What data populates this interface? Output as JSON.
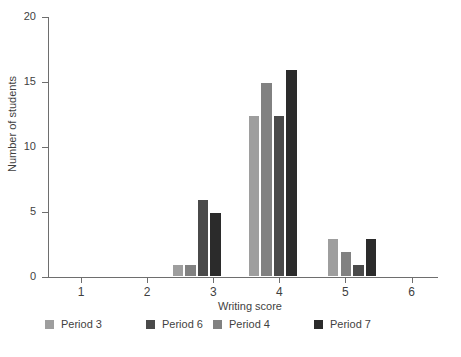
{
  "chart_data": {
    "type": "bar",
    "title": "",
    "subtitle": "",
    "xlabel": "Writing score",
    "ylabel": "Number of students",
    "xlim": [
      0.5,
      6.4
    ],
    "ylim": [
      0,
      20
    ],
    "xticks": [
      1,
      2,
      3,
      4,
      5,
      6
    ],
    "xtick_labels": [
      "1",
      "2",
      "3",
      "4",
      "5",
      "6"
    ],
    "yticks": [
      0,
      5,
      10,
      15,
      20
    ],
    "ytick_labels": [
      "0",
      "5",
      "10",
      "15",
      "20"
    ],
    "grid": false,
    "legend_position": "below-left",
    "bar_width": 0.19,
    "categories": [
      2.75,
      3.9,
      5.1
    ],
    "category_labels": [
      "2.75",
      "3.9",
      "5.1"
    ],
    "series": [
      {
        "name": "Period 3",
        "color": "#9e9e9e",
        "values": [
          1,
          12.5,
          3
        ]
      },
      {
        "name": "Period 4",
        "color": "#818181",
        "values": [
          1,
          15,
          2
        ]
      },
      {
        "name": "Period 6",
        "color": "#4a4a4a",
        "values": [
          6,
          12.5,
          1
        ]
      },
      {
        "name": "Period 7",
        "color": "#2b2b2b",
        "values": [
          5,
          16,
          3
        ]
      }
    ],
    "axis_color": "#6e6e6e",
    "text_color": "#3f3f3f",
    "background": "#ffffff"
  },
  "legend": {
    "entries": [
      {
        "label": "Period 3",
        "color": "#9e9e9e"
      },
      {
        "label": "Period 4",
        "color": "#818181"
      },
      {
        "label": "Period 6",
        "color": "#4a4a4a"
      },
      {
        "label": "Period 7",
        "color": "#2b2b2b"
      }
    ]
  }
}
